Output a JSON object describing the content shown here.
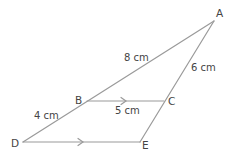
{
  "diagram": {
    "type": "similar-triangles",
    "line_color": "#9a9a9a",
    "text_color": "#444444",
    "points": {
      "A": {
        "label": "A",
        "x": 214,
        "y": 21
      },
      "B": {
        "label": "B",
        "x": 87,
        "y": 101
      },
      "C": {
        "label": "C",
        "x": 164,
        "y": 101
      },
      "D": {
        "label": "D",
        "x": 23,
        "y": 142
      },
      "E": {
        "label": "E",
        "x": 140,
        "y": 142
      }
    },
    "segments": [
      {
        "from": "A",
        "to": "D"
      },
      {
        "from": "A",
        "to": "E"
      },
      {
        "from": "B",
        "to": "C",
        "parallel_arrow": true
      },
      {
        "from": "D",
        "to": "E",
        "parallel_arrow": true
      }
    ],
    "measurements": {
      "AB": "8 cm",
      "AC": "6 cm",
      "BC": "5 cm",
      "BD": "4 cm"
    }
  }
}
